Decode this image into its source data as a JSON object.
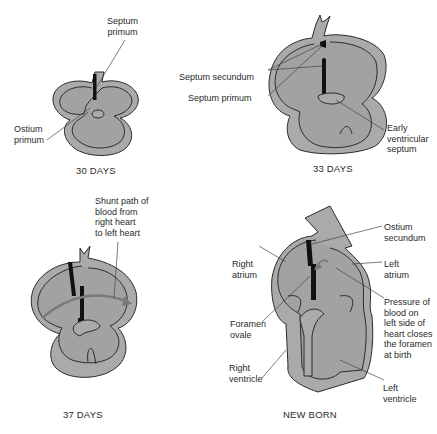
{
  "colors": {
    "heart_fill": "#a9a9a9",
    "inner_fill": "#a0a0a0",
    "outline": "#2b2b2b",
    "septum": "#111111",
    "arrow": "#7a7a7a"
  },
  "panels": [
    {
      "caption": "30 DAYS",
      "labels": {
        "septum_primum": "Septum\nprimum",
        "ostium_primum": "Ostium\nprimum"
      }
    },
    {
      "caption": "33 DAYS",
      "labels": {
        "septum_secundum": "Septum secundum",
        "septum_primum": "Septum primum",
        "early_ventricular_septum": "Early\nventricular\nseptum"
      }
    },
    {
      "caption": "37 DAYS",
      "labels": {
        "shunt_path": "Shunt path of\nblood from\nright heart\nto left heart"
      }
    },
    {
      "caption": "NEW BORN",
      "labels": {
        "ostium_secundum": "Ostium\nsecundum",
        "right_atrium": "Right\natrium",
        "left_atrium": "Left\natrium",
        "foramen_ovale": "Foramen\novale",
        "pressure_note": "Pressure of\nblood on\nleft side of\nheart closes\nthe foramen\nat birth",
        "right_ventricle": "Right\nventricle",
        "left_ventricle": "Left\nventricle"
      }
    }
  ]
}
